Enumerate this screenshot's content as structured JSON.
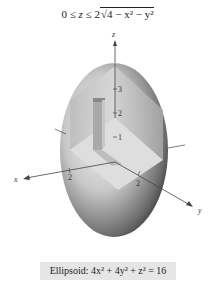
{
  "header": {
    "inequality": "0 ≤ z ≤ 2√(4 − x² − y²)",
    "part1": "0 ≤ ",
    "var_z": "z",
    "part2": " ≤ 2",
    "radicand": "4 − x² − y²"
  },
  "figure": {
    "axes": {
      "x": "x",
      "y": "y",
      "z": "z"
    },
    "z_ticks": [
      "1",
      "2",
      "3"
    ],
    "x_tick": "2",
    "y_tick": "2",
    "surface": "ellipsoid (cutaway upper-front octant)",
    "colors": {
      "shade_dark": "#1a1a1a",
      "shade_light": "#f2f2f2",
      "axis": "#444444"
    }
  },
  "caption": {
    "text": "Ellipsoid: 4x² + 4y² + z² = 16"
  }
}
